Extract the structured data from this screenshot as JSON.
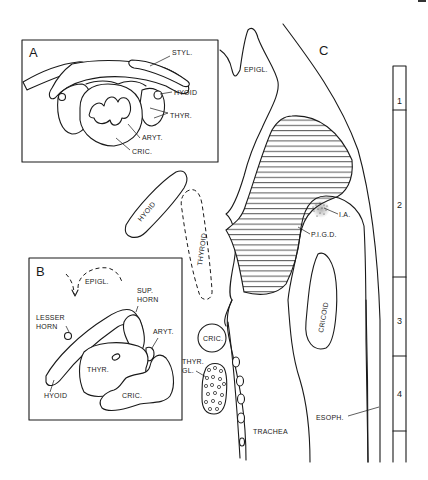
{
  "figure": {
    "type": "anatomical line drawing",
    "colors": {
      "ink": "#1a1a1a",
      "background": "#ffffff"
    }
  },
  "panel_a": {
    "letter": "A",
    "labels": {
      "styl": "STYL.",
      "hyoid": "HYOID",
      "thyr": "THYR.",
      "aryt": "ARYT.",
      "cric": "CRIC."
    }
  },
  "panel_b": {
    "letter": "B",
    "labels": {
      "epigl": "EPIGL.",
      "sup_horn_1": "SUP.",
      "sup_horn_2": "HORN",
      "lesser_horn_1": "LESSER",
      "lesser_horn_2": "HORN",
      "aryt": "ARYT.",
      "thyr": "THYR.",
      "hyoid": "HYOID",
      "cric": "CRIC."
    }
  },
  "panel_c": {
    "letter": "C",
    "labels": {
      "epigl": "EPIGL.",
      "hyoid": "HYOID",
      "thyroid": "THYROID",
      "ia": "I.A.",
      "pigd": "P.I.G.D.",
      "cricoid": "CRICOID",
      "cric": "CRIC.",
      "thyr_gl_1": "THYR.",
      "thyr_gl_2": "GL.",
      "trachea": "TRACHEA",
      "esoph": "ESOPH."
    }
  },
  "scale_bar": {
    "segments": [
      "1",
      "2",
      "3",
      "4"
    ]
  }
}
